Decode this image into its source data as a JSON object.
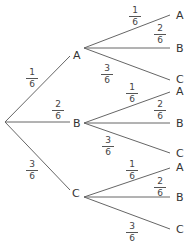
{
  "tree": {
    "type": "probability-tree",
    "root": "",
    "first_stage": [
      {
        "label": "A",
        "prob": {
          "num": "1",
          "den": "6"
        }
      },
      {
        "label": "B",
        "prob": {
          "num": "2",
          "den": "6"
        }
      },
      {
        "label": "C",
        "prob": {
          "num": "3",
          "den": "6"
        }
      }
    ],
    "second_stage": {
      "A": [
        {
          "label": "A",
          "prob": {
            "num": "1",
            "den": "6"
          }
        },
        {
          "label": "B",
          "prob": {
            "num": "2",
            "den": "6"
          }
        },
        {
          "label": "C",
          "prob": {
            "num": "3",
            "den": "6"
          }
        }
      ],
      "B": [
        {
          "label": "A",
          "prob": {
            "num": "1",
            "den": "6"
          }
        },
        {
          "label": "B",
          "prob": {
            "num": "2",
            "den": "6"
          }
        },
        {
          "label": "C",
          "prob": {
            "num": "3",
            "den": "6"
          }
        }
      ],
      "C": [
        {
          "label": "A",
          "prob": {
            "num": "1",
            "den": "6"
          }
        },
        {
          "label": "B",
          "prob": {
            "num": "2",
            "den": "6"
          }
        },
        {
          "label": "C",
          "prob": {
            "num": "3",
            "den": "6"
          }
        }
      ]
    }
  },
  "colors": {
    "line": "#555555",
    "text": "#333333",
    "background": "#ffffff"
  }
}
